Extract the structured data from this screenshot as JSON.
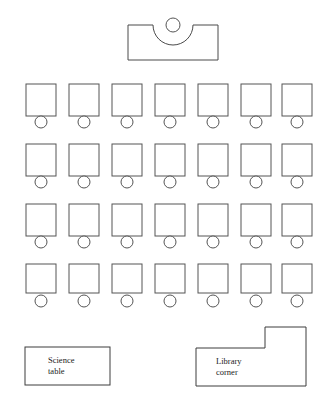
{
  "diagram": {
    "background_color": "#ffffff",
    "line_color": "#4a4a4a",
    "text_color": "#1a1a1a"
  },
  "teacher_area": {
    "desk": {
      "label": "teacher-desk",
      "x": 128,
      "y": 25,
      "width": 90,
      "height": 35,
      "notch": {
        "shape": "semicircle",
        "center_x": 173,
        "radius": 20
      }
    },
    "chair": {
      "label": "teacher-chair",
      "center_x": 173,
      "center_y": 25,
      "radius": 7
    }
  },
  "student_seating": {
    "rows_count": 4,
    "columns_count": 7,
    "total_desks": 28,
    "desk_size": 30,
    "chair_radius": 6,
    "column_x": [
      26,
      69,
      112,
      155,
      198,
      241,
      282
    ],
    "rows": [
      {
        "name": "row-1",
        "desk_y": 84,
        "desk_height": 32,
        "chair_cy": 122
      },
      {
        "name": "row-2",
        "desk_y": 144,
        "desk_height": 32,
        "chair_cy": 182
      },
      {
        "name": "row-3",
        "desk_y": 204,
        "desk_height": 32,
        "chair_cy": 242
      },
      {
        "name": "row-4",
        "desk_y": 264,
        "desk_height": 29,
        "chair_cy": 301
      }
    ]
  },
  "zones": [
    {
      "name": "science-table",
      "label_lines": [
        "Science",
        "table"
      ],
      "shape": "rectangle",
      "x": 25,
      "y": 347,
      "width": 85,
      "height": 38,
      "text_x": 48,
      "text_y": 361
    },
    {
      "name": "library-corner",
      "label_lines": [
        "Library",
        "corner"
      ],
      "shape": "l-shape",
      "points": "196,348 265,348 265,327 306,327 306,386 196,386",
      "text_x": 216,
      "text_y": 362
    }
  ]
}
